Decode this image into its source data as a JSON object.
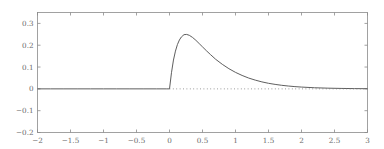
{
  "figure": {
    "background_color": "#ffffff",
    "frame_color": "#8a8a8a",
    "curve_color": "#555555",
    "baseline_color": "#777777",
    "tick_label_color": "#6b6b6b"
  },
  "chart_data": {
    "type": "line",
    "title": "",
    "subtitle": "",
    "xlabel": "",
    "ylabel": "",
    "xlim": [
      -2,
      3
    ],
    "ylim": [
      -0.2,
      0.35
    ],
    "grid": false,
    "legend": null,
    "legend_position": "none",
    "xticks": [
      -2,
      -1.5,
      -1,
      -0.5,
      0,
      0.5,
      1,
      1.5,
      2,
      2.5,
      3
    ],
    "xticklabels": [
      "-2",
      "-1.5",
      "-1",
      "-0.5",
      "0",
      "0.5",
      "1",
      "1.5",
      "2",
      "2.5",
      "3"
    ],
    "yticks": [
      -0.2,
      -0.1,
      0,
      0.1,
      0.2,
      0.3
    ],
    "yticklabels": [
      "-0.2",
      "-0.1",
      "0",
      "0.1",
      "0.2",
      "0.3"
    ],
    "annotations": [],
    "series": [
      {
        "name": "impulse-response",
        "style": "solid",
        "color": "#555555",
        "x": [
          -2.0,
          -1.8,
          -1.6,
          -1.4,
          -1.2,
          -1.0,
          -0.8,
          -0.6,
          -0.4,
          -0.2,
          -0.05,
          0.0,
          0.03,
          0.06,
          0.09,
          0.12,
          0.15,
          0.18,
          0.22,
          0.26,
          0.3,
          0.35,
          0.4,
          0.45,
          0.5,
          0.56,
          0.62,
          0.7,
          0.8,
          0.9,
          1.0,
          1.1,
          1.2,
          1.3,
          1.4,
          1.5,
          1.6,
          1.7,
          1.8,
          1.9,
          2.0,
          2.2,
          2.4,
          2.6,
          2.8,
          3.0
        ],
        "y": [
          0.0,
          0.0,
          0.0,
          0.0,
          0.0,
          0.0,
          0.0,
          0.0,
          0.0,
          0.0,
          0.0,
          0.0,
          0.074,
          0.132,
          0.173,
          0.203,
          0.224,
          0.238,
          0.2485,
          0.2495,
          0.2455,
          0.2355,
          0.2225,
          0.2075,
          0.1925,
          0.1745,
          0.1575,
          0.1355,
          0.1125,
          0.0925,
          0.0755,
          0.0615,
          0.0495,
          0.04,
          0.032,
          0.0255,
          0.0205,
          0.0163,
          0.013,
          0.0103,
          0.0082,
          0.0051,
          0.0032,
          0.002,
          0.0012,
          0.0007
        ]
      },
      {
        "name": "zero-baseline",
        "style": "dotted",
        "color": "#777777",
        "x": [
          0.0,
          3.0
        ],
        "y": [
          0.0,
          0.0
        ]
      }
    ]
  }
}
